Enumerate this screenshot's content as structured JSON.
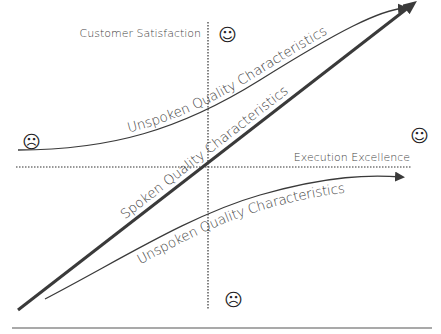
{
  "diagram": {
    "axes": {
      "vertical_label": "Customer Satisfaction",
      "horizontal_label": "Execution Excellence"
    },
    "curves": [
      {
        "name": "unspoken-upper",
        "label": "Unspoken Quality Characteristics"
      },
      {
        "name": "spoken",
        "label": "Spoken Quality Characteristics"
      },
      {
        "name": "unspoken-lower",
        "label": "Unspoken Quality Characteristics"
      }
    ],
    "faces": {
      "top": "☺",
      "right": "☺",
      "left": "☹",
      "bottom": "☹"
    },
    "colors": {
      "line": "#3a3a3a",
      "text": "#444444",
      "axis": "#333333"
    }
  }
}
